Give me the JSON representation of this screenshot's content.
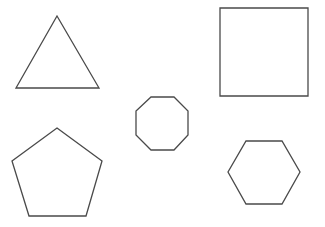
{
  "canvas": {
    "width": 325,
    "height": 227,
    "background": "#ffffff"
  },
  "style": {
    "stroke": "#4a4a4a",
    "fill": "#ffffff"
  },
  "shapes": [
    {
      "type": "triangle",
      "sides": 3,
      "points": "57,16 99,88 16,88"
    },
    {
      "type": "square",
      "sides": 4,
      "points": "220,8 308,8 308,96 220,96"
    },
    {
      "type": "octagon",
      "sides": 8,
      "points": "151,97 174,97 188,111 188,135 174,150 151,150 136,135 136,111"
    },
    {
      "type": "pentagon",
      "sides": 5,
      "points": "57,128 102,161 86,216 29,216 12,161"
    },
    {
      "type": "hexagon",
      "sides": 6,
      "points": "246,141 282,141 300,172 282,204 246,204 228,172"
    }
  ]
}
